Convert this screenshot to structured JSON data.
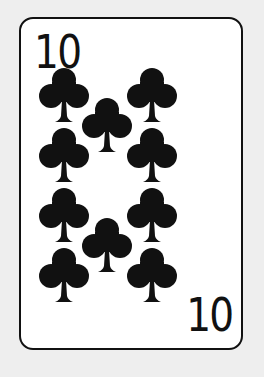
{
  "card": {
    "rank": "10",
    "suit": "clubs",
    "suit_color": "#111111",
    "corner_top_left": "10",
    "corner_bottom_right": "10",
    "pip_count": 10
  },
  "pips": [
    {
      "x": 62,
      "y": 64
    },
    {
      "x": 150,
      "y": 64
    },
    {
      "x": 105,
      "y": 94
    },
    {
      "x": 62,
      "y": 124
    },
    {
      "x": 150,
      "y": 124
    },
    {
      "x": 62,
      "y": 184
    },
    {
      "x": 150,
      "y": 184
    },
    {
      "x": 105,
      "y": 214
    },
    {
      "x": 62,
      "y": 244
    },
    {
      "x": 150,
      "y": 244
    }
  ]
}
